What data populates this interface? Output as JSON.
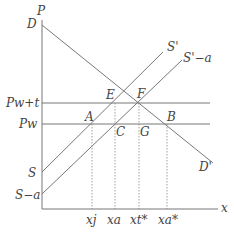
{
  "diagram": {
    "type": "supply-demand-tariff",
    "axes": {
      "y_label": "P",
      "x_label": "x"
    },
    "price_levels": [
      {
        "label": "Pw+t",
        "y": 103
      },
      {
        "label": "Pw",
        "y": 124
      }
    ],
    "curves": [
      {
        "name": "D",
        "start_label": "D",
        "end_label": "D'",
        "from": [
          42,
          25
        ],
        "to": [
          213,
          163
        ]
      },
      {
        "name": "S",
        "start_label": "S",
        "end_label": "S'",
        "from": [
          42,
          172
        ],
        "to": [
          163,
          52
        ]
      },
      {
        "name": "S-a",
        "start_label": "S−a",
        "end_label": "S'−a",
        "from": [
          42,
          194
        ],
        "to": [
          182,
          60
        ]
      }
    ],
    "points": [
      {
        "label": "A",
        "x": 92,
        "y": 124
      },
      {
        "label": "C",
        "x": 115,
        "y": 124
      },
      {
        "label": "G",
        "x": 139,
        "y": 124
      },
      {
        "label": "B",
        "x": 167,
        "y": 124
      },
      {
        "label": "E",
        "x": 115,
        "y": 103
      },
      {
        "label": "F",
        "x": 139,
        "y": 103
      }
    ],
    "x_ticks": [
      {
        "label": "xj",
        "x": 92
      },
      {
        "label": "xa",
        "x": 115
      },
      {
        "label": "xt*",
        "x": 139
      },
      {
        "label": "xa*",
        "x": 167
      }
    ],
    "labels": {
      "P": "P",
      "x": "x",
      "D": "D",
      "D_end": "D'",
      "S": "S",
      "S_end": "S'",
      "Sa": "S−a",
      "Sa_end": "S'−a",
      "Pwt": "Pw+t",
      "Pw": "Pw",
      "A": "A",
      "B": "B",
      "C": "C",
      "E": "E",
      "F": "F",
      "G": "G",
      "xj": "xj",
      "xa": "xa",
      "xt": "xt*",
      "xa_star": "xa*"
    }
  }
}
